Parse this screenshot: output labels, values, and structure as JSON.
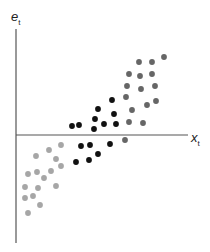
{
  "chart_data": {
    "type": "scatter",
    "title": "",
    "xlabel": "x",
    "xlabel_subscript": "t",
    "ylabel": "e",
    "ylabel_subscript": "t",
    "grid": false,
    "legend": null,
    "ticks": false,
    "axes": {
      "origin_px": [
        16,
        135
      ],
      "x_axis_end_px": 188,
      "y_axis_top_px": 29,
      "y_axis_bottom_px": 243
    },
    "colors": {
      "axis": "#555555",
      "upper_right": "#666666",
      "middle": "#111111",
      "lower_left": "#a6a6a6"
    },
    "series": [
      {
        "name": "lower-left cluster",
        "color": "#a6a6a6",
        "points_px": [
          [
            61,
            145
          ],
          [
            49,
            150
          ],
          [
            36,
            156
          ],
          [
            56,
            159
          ],
          [
            61,
            166
          ],
          [
            51,
            171
          ],
          [
            37,
            172
          ],
          [
            28,
            174
          ],
          [
            44,
            178
          ],
          [
            25,
            187
          ],
          [
            38,
            188
          ],
          [
            56,
            186
          ],
          [
            25,
            198
          ],
          [
            33,
            196
          ],
          [
            40,
            205
          ],
          [
            28,
            213
          ]
        ]
      },
      {
        "name": "middle cluster",
        "color": "#111111",
        "points_px": [
          [
            72,
            126
          ],
          [
            79,
            125
          ],
          [
            95,
            119
          ],
          [
            94,
            129
          ],
          [
            98,
            109
          ],
          [
            104,
            124
          ],
          [
            112,
            100
          ],
          [
            114,
            114
          ],
          [
            116,
            124
          ],
          [
            81,
            146
          ],
          [
            90,
            145
          ],
          [
            110,
            144
          ],
          [
            98,
            154
          ],
          [
            89,
            160
          ],
          [
            76,
            162
          ]
        ]
      },
      {
        "name": "upper-right cluster",
        "color": "#666666",
        "points_px": [
          [
            139,
            62
          ],
          [
            152,
            62
          ],
          [
            164,
            57
          ],
          [
            129,
            74
          ],
          [
            140,
            76
          ],
          [
            152,
            74
          ],
          [
            127,
            86
          ],
          [
            141,
            89
          ],
          [
            155,
            86
          ],
          [
            126,
            97
          ],
          [
            156,
            101
          ],
          [
            147,
            105
          ],
          [
            132,
            110
          ],
          [
            129,
            122
          ],
          [
            143,
            123
          ],
          [
            125,
            140
          ]
        ]
      }
    ]
  },
  "labels": {
    "y_main": "e",
    "y_sub": "t",
    "x_main": "x",
    "x_sub": "t"
  }
}
